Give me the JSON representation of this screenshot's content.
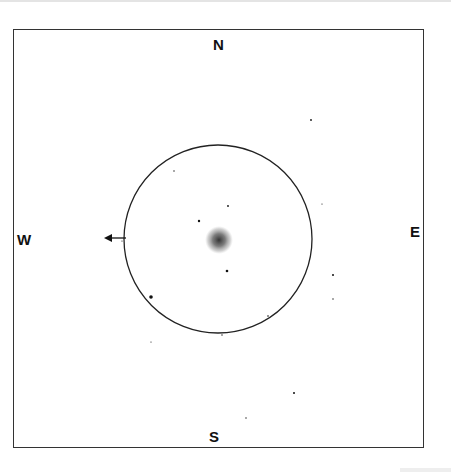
{
  "sketch": {
    "labels": {
      "north": "N",
      "south": "S",
      "east": "E",
      "west": "W"
    },
    "field_of_view": {
      "cx": 218,
      "cy": 239,
      "r": 94,
      "stroke": "#222222"
    },
    "object": {
      "type": "nebula",
      "cx": 219,
      "cy": 240,
      "r": 14,
      "color": "#555555"
    },
    "drift_arrow": {
      "direction": "west",
      "x1": 126,
      "y1": 238,
      "x2": 104,
      "y2": 238
    },
    "stars": [
      {
        "x": 174,
        "y": 171,
        "r": 0.7
      },
      {
        "x": 228,
        "y": 206,
        "r": 0.9
      },
      {
        "x": 199,
        "y": 221,
        "r": 1.2
      },
      {
        "x": 227,
        "y": 271,
        "r": 1.3
      },
      {
        "x": 151,
        "y": 297,
        "r": 1.8
      },
      {
        "x": 268,
        "y": 316,
        "r": 0.8
      },
      {
        "x": 222,
        "y": 335,
        "r": 0.7
      },
      {
        "x": 151,
        "y": 342,
        "r": 0.6
      },
      {
        "x": 311,
        "y": 120,
        "r": 0.9
      },
      {
        "x": 322,
        "y": 204,
        "r": 0.6
      },
      {
        "x": 333,
        "y": 275,
        "r": 1.0
      },
      {
        "x": 333,
        "y": 299,
        "r": 0.7
      },
      {
        "x": 294,
        "y": 393,
        "r": 1.0
      },
      {
        "x": 246,
        "y": 418,
        "r": 0.7
      },
      {
        "x": 122,
        "y": 241,
        "r": 0.6
      }
    ]
  }
}
